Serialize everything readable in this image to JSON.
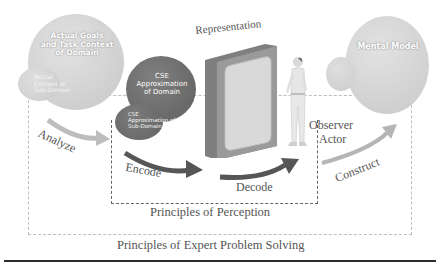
{
  "diagram": {
    "nodes": {
      "actual_goals": {
        "title": "Actual Goals and Task Context of Domain",
        "title_lines": [
          "Actual Goals",
          "and Task Context",
          "of Domain"
        ],
        "sub": "Actual Context of Sub-Domain",
        "sub_lines": [
          "Actual",
          "Context of",
          "Sub-Domain"
        ]
      },
      "cse": {
        "title_lines": [
          "CSE",
          "Approximation",
          "of Domain"
        ],
        "sub_lines": [
          "CSE",
          "Approximation of",
          "Sub-Domain"
        ]
      },
      "representation": {
        "label": "Representation"
      },
      "observer": {
        "label_lines": [
          "Observer",
          "Actor"
        ]
      },
      "mental_model": {
        "label": "Mental Model"
      }
    },
    "arrows": {
      "analyze": "Analyze",
      "encode": "Encode",
      "decode": "Decode",
      "construct": "Construct"
    },
    "boxes": {
      "inner": "Principles of Perception",
      "outer": "Principles of Expert Problem Solving"
    },
    "colors": {
      "light_circle": "#cfcfcf",
      "dark_circle": "#6f6f6f",
      "panel_frame": "#8a8a8a",
      "panel_face": "#d6d6d6",
      "arrow_dark": "#555555",
      "arrow_light": "#b5b5b5",
      "text": "#555555"
    }
  }
}
